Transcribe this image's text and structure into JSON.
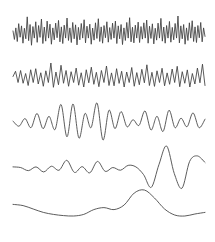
{
  "figure": {
    "title": "",
    "background_color": "#ffffff",
    "stroke_color": "#4a4a4a",
    "width": 215,
    "height": 242
  },
  "chart_data": {
    "type": "line",
    "title": "",
    "xlabel": "",
    "ylabel": "",
    "grid": false,
    "legend_position": "none",
    "axis_visible": false,
    "x_range": [
      0,
      1
    ],
    "x_pixel_start": 13,
    "x_pixel_end": 205,
    "series": [
      {
        "name": "trace-1",
        "baseline_y": 33,
        "amplitude": 17,
        "frequency_label": "highest",
        "samples": [
          0.12,
          -0.38,
          0.3,
          -0.5,
          0.55,
          -0.25,
          0.42,
          -0.6,
          0.28,
          -0.34,
          0.95,
          -0.45,
          0.5,
          -0.72,
          0.38,
          -0.3,
          0.66,
          -0.55,
          0.44,
          -0.26,
          0.82,
          -0.62,
          0.35,
          -0.48,
          0.7,
          -0.3,
          0.52,
          -0.66,
          0.3,
          -0.4,
          0.58,
          -0.28,
          0.74,
          -0.52,
          0.36,
          -0.62,
          0.46,
          -0.3,
          0.88,
          -0.44,
          0.3,
          -0.56,
          0.62,
          -0.34,
          0.48,
          -0.7,
          0.33,
          -0.4,
          0.56,
          -0.3,
          0.78,
          -0.58,
          0.4,
          -0.3,
          0.52,
          -0.66,
          0.29,
          -0.42,
          0.6,
          -0.32,
          0.84,
          -0.5,
          0.36,
          -0.6,
          0.44,
          -0.28,
          0.66,
          -0.54,
          0.32,
          -0.38,
          0.58,
          -0.3,
          0.7,
          -0.62,
          0.42,
          -0.34,
          0.5,
          -0.68,
          0.3,
          -0.44,
          0.62,
          -0.3,
          0.9,
          -0.52,
          0.34,
          -0.58,
          0.46,
          -0.3,
          0.64,
          -0.56,
          0.38,
          -0.36,
          0.6,
          -0.3,
          0.76,
          -0.6,
          0.4,
          -0.32,
          0.54,
          -0.64,
          0.28,
          -0.42,
          0.58,
          -0.3,
          0.86,
          -0.48,
          0.35,
          -0.6,
          0.44,
          -0.3,
          0.68,
          -0.54,
          0.33,
          -0.4,
          0.56,
          -0.3,
          1.0,
          -0.58,
          0.42,
          -0.34,
          0.5,
          -0.66,
          0.3,
          -0.44,
          0.6,
          -0.3,
          0.72,
          -0.5,
          0.36,
          -0.56,
          0.44,
          -0.28,
          0.62,
          -0.52,
          0.3,
          -0.2
        ]
      },
      {
        "name": "trace-2",
        "baseline_y": 78,
        "amplitude": 15,
        "frequency_label": "high",
        "samples": [
          0.1,
          0.45,
          -0.3,
          0.5,
          -0.35,
          0.3,
          -0.5,
          0.55,
          -0.3,
          0.62,
          -0.4,
          0.35,
          -0.55,
          0.48,
          -0.3,
          1.0,
          -0.62,
          0.4,
          -0.45,
          0.85,
          -0.35,
          0.5,
          -0.55,
          0.42,
          -0.3,
          0.66,
          -0.48,
          0.35,
          -0.6,
          0.55,
          -0.32,
          0.72,
          -0.42,
          0.38,
          -0.58,
          0.5,
          -0.3,
          0.8,
          -0.5,
          0.34,
          -0.52,
          0.62,
          -0.36,
          0.45,
          -0.6,
          0.4,
          -0.3,
          0.7,
          -0.55,
          0.36,
          -0.45,
          0.58,
          -0.32,
          0.88,
          -0.5,
          0.38,
          -0.56,
          0.48,
          -0.3,
          0.65,
          -0.52,
          0.34,
          -0.42,
          0.6,
          -0.3,
          0.78,
          -0.58,
          0.42,
          -0.35,
          0.54,
          -0.6,
          0.3,
          -0.4,
          0.66,
          -0.32,
          0.92,
          -0.5
        ]
      },
      {
        "name": "trace-3",
        "baseline_y": 122,
        "amplitude": 19,
        "frequency_label": "mid",
        "samples": [
          0.05,
          -0.22,
          0.18,
          -0.3,
          0.45,
          -0.35,
          0.3,
          -0.4,
          0.92,
          -0.78,
          0.95,
          -0.85,
          0.45,
          -0.3,
          1.0,
          -0.95,
          0.62,
          -0.35,
          0.55,
          -0.25,
          0.12,
          -0.18,
          0.58,
          -0.42,
          0.3,
          -0.5,
          0.62,
          -0.3,
          0.2,
          -0.25,
          0.48,
          -0.3,
          0.15
        ]
      },
      {
        "name": "trace-4",
        "baseline_y": 168,
        "amplitude": 22,
        "frequency_label": "low",
        "samples": [
          0.05,
          0.02,
          -0.12,
          0.05,
          -0.18,
          0.08,
          -0.1,
          0.35,
          -0.2,
          0.06,
          -0.22,
          0.3,
          -0.15,
          0.02,
          -0.1,
          0.12,
          0.05,
          -0.3,
          -0.88,
          0.15,
          1.0,
          -0.25,
          -0.92,
          0.3,
          0.55,
          0.25
        ]
      },
      {
        "name": "trace-5",
        "baseline_y": 210,
        "amplitude": 20,
        "frequency_label": "lowest",
        "samples": [
          0.28,
          0.22,
          0.05,
          -0.12,
          -0.22,
          -0.28,
          -0.3,
          -0.22,
          0.02,
          0.12,
          0.02,
          0.25,
          0.85,
          1.0,
          0.6,
          0.05,
          -0.25,
          -0.3,
          -0.2,
          -0.12
        ]
      }
    ]
  }
}
